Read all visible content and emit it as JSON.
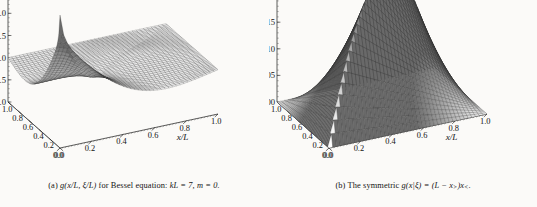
{
  "figure": {
    "background_color": "#fbfaf8",
    "ink_color": "#141414",
    "panel_count": 2
  },
  "panels": [
    {
      "id": "panel-a",
      "caption_label": "(a)",
      "caption_text": "g(x/L, ξ/L) for Bessel equation: kL = 7, m = 0.",
      "caption_parts": {
        "label": "(a)",
        "func": "g(x/L, ξ/L)",
        "middle": "for Bessel equation:",
        "param1": "kL = 7,",
        "param2": "m = 0."
      },
      "chart_data": {
        "type": "surface",
        "title": "g(x/L, ξ/L) for Bessel equation: kL = 7, m = 0.",
        "xlabel": "x/L",
        "ylabel": "ξ/L",
        "zlabel": "",
        "xlim": [
          0.0,
          1.0
        ],
        "ylim": [
          0.0,
          1.0
        ],
        "zlim": [
          -1.0,
          2.0
        ],
        "x_ticks": [
          "0.0",
          "0.2",
          "0.4",
          "0.6",
          "0.8",
          "1.0"
        ],
        "x_tick_values": [
          0.0,
          0.2,
          0.4,
          0.6,
          0.8,
          1.0
        ],
        "y_ticks": [
          "0.0",
          "0.2",
          "0.4",
          "0.6",
          "0.8",
          "1.0"
        ],
        "y_tick_values": [
          0.0,
          0.2,
          0.4,
          0.6,
          0.8,
          1.0
        ],
        "z_ticks": [
          "-1.0",
          "-0.5",
          "0.0",
          "0.5",
          "1.0",
          "1.5",
          "2.0"
        ],
        "z_tick_values": [
          -1.0,
          -0.5,
          0.0,
          0.5,
          1.0,
          1.5,
          2.0
        ],
        "grid": false,
        "legend": false,
        "mesh_n": 42,
        "surface": "bessel_green",
        "params": {
          "kL": 7,
          "m": 0
        },
        "notes": "Oscillatory Green's function surface with two deep troughs and a cusp ridge along x=ξ; dark folded edges at the far corners."
      }
    },
    {
      "id": "panel-b",
      "caption_label": "(b)",
      "caption_text": "The symmetric g(x|ξ) = (L - x>)x<.",
      "caption_parts": {
        "label": "(b)",
        "middle": "The symmetric",
        "func": "g(x|ξ) = (L − x",
        "sub1": ">",
        "mid2": ")x",
        "sub2": "<",
        "end": "."
      },
      "chart_data": {
        "type": "surface",
        "title": "The symmetric g(x|ξ) = (L - x>)x<.",
        "xlabel": "x/L",
        "ylabel": "ξ/L",
        "zlabel": "",
        "xlim": [
          0.0,
          1.0
        ],
        "ylim": [
          0.0,
          1.0
        ],
        "zlim": [
          0.0,
          0.25
        ],
        "x_ticks": [
          "0.0",
          "0.2",
          "0.4",
          "0.6",
          "0.8",
          "1.0"
        ],
        "x_tick_values": [
          0.0,
          0.2,
          0.4,
          0.6,
          0.8,
          1.0
        ],
        "y_ticks": [
          "0.0",
          "0.2",
          "0.4",
          "0.6",
          "0.8",
          "1.0"
        ],
        "y_tick_values": [
          0.0,
          0.2,
          0.4,
          0.6,
          0.8,
          1.0
        ],
        "z_ticks": [
          "0.00",
          "0.05",
          "0.10",
          "0.15",
          "0.20",
          "0.25"
        ],
        "z_tick_values": [
          0.0,
          0.05,
          0.1,
          0.15,
          0.2,
          0.25
        ],
        "grid": false,
        "legend": false,
        "mesh_n": 42,
        "surface": "min_max_product",
        "params": {
          "L": 1
        },
        "peak_value": 0.25,
        "peak_at": [
          0.5,
          0.5
        ],
        "notes": "Tent-shaped symmetric surface (L - max(x,ξ))·min(x,ξ), peaking at 0.25 at x=ξ=0.5, zero on all four boundaries."
      }
    }
  ]
}
